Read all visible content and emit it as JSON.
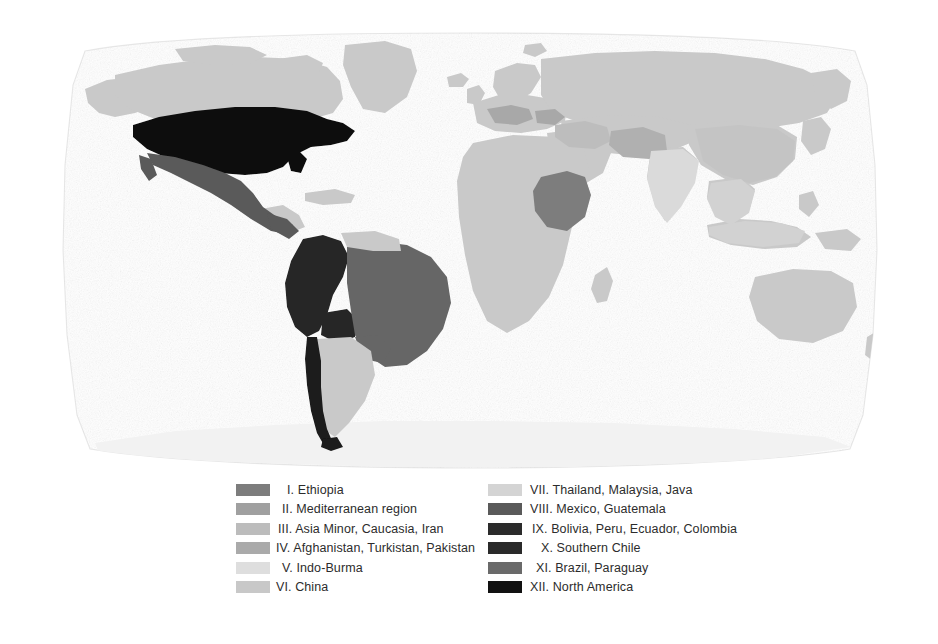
{
  "figure": {
    "kind": "world-map-with-legend",
    "title": "",
    "background_color": "#ffffff"
  },
  "map": {
    "projection": "robinson",
    "ocean_color": "#ffffff",
    "frame_color": "#e8e8e8",
    "default_land_color": "#c9c9c9",
    "antarctica_color": "#f2f2f2",
    "regions": [
      {
        "id": "XII",
        "name": "North America (USA)",
        "color": "#0d0d0d"
      },
      {
        "id": "VIII",
        "name": "Mexico, Guatemala",
        "color": "#5a5a5a"
      },
      {
        "id": "IX",
        "name": "Bolivia, Peru, Ecuador, Colombia",
        "color": "#262626"
      },
      {
        "id": "X",
        "name": "Southern Chile",
        "color": "#1a1a1a"
      },
      {
        "id": "XI",
        "name": "Brazil, Paraguay",
        "color": "#666666"
      },
      {
        "id": "I",
        "name": "Ethiopia",
        "color": "#7d7d7d"
      },
      {
        "id": "II",
        "name": "Mediterranean region",
        "color": "#a8a8a8"
      },
      {
        "id": "III",
        "name": "Asia Minor, Caucasia, Iran",
        "color": "#bdbdbd"
      },
      {
        "id": "IV",
        "name": "Afghanistan, Turkistan, Pakistan",
        "color": "#b0b0b0"
      },
      {
        "id": "V",
        "name": "Indo-Burma",
        "color": "#dadada"
      },
      {
        "id": "VI",
        "name": "China",
        "color": "#c4c4c4"
      },
      {
        "id": "VII",
        "name": "Thailand, Malaysia, Java",
        "color": "#d2d2d2"
      }
    ]
  },
  "legend": {
    "columns": [
      {
        "id": "left",
        "items": [
          {
            "numeral": "I.",
            "label": "I. Ethiopia",
            "color": "#7d7d7d",
            "indent": "ind-1"
          },
          {
            "numeral": "II.",
            "label": "II. Mediterranean region",
            "color": "#a0a0a0",
            "indent": "ind-2"
          },
          {
            "numeral": "III.",
            "label": "III. Asia Minor, Caucasia, Iran",
            "color": "#bcbcbc",
            "indent": "ind-3"
          },
          {
            "numeral": "IV.",
            "label": "IV. Afghanistan, Turkistan, Pakistan",
            "color": "#aaaaaa",
            "indent": "ind-0"
          },
          {
            "numeral": "V.",
            "label": "V. Indo-Burma",
            "color": "#dedede",
            "indent": "ind-2"
          },
          {
            "numeral": "VI.",
            "label": "VI. China",
            "color": "#c8c8c8",
            "indent": "ind-0"
          }
        ]
      },
      {
        "id": "right",
        "items": [
          {
            "numeral": "VII.",
            "label": "VII. Thailand, Malaysia, Java",
            "color": "#d4d4d4",
            "indent": "ind-0"
          },
          {
            "numeral": "VIII.",
            "label": "VIII. Mexico, Guatemala",
            "color": "#5a5a5a",
            "indent": "ind-0"
          },
          {
            "numeral": "IX.",
            "label": "IX. Bolivia, Peru, Ecuador, Colombia",
            "color": "#2b2b2b",
            "indent": "ind-3"
          },
          {
            "numeral": "X.",
            "label": "X. Southern Chile",
            "color": "#2a2a2a",
            "indent": "ind-1"
          },
          {
            "numeral": "XI.",
            "label": "XI. Brazil, Paraguay",
            "color": "#6a6a6a",
            "indent": "ind-2"
          },
          {
            "numeral": "XII.",
            "label": "XII. North America",
            "color": "#111111",
            "indent": "ind-0"
          }
        ]
      }
    ]
  }
}
